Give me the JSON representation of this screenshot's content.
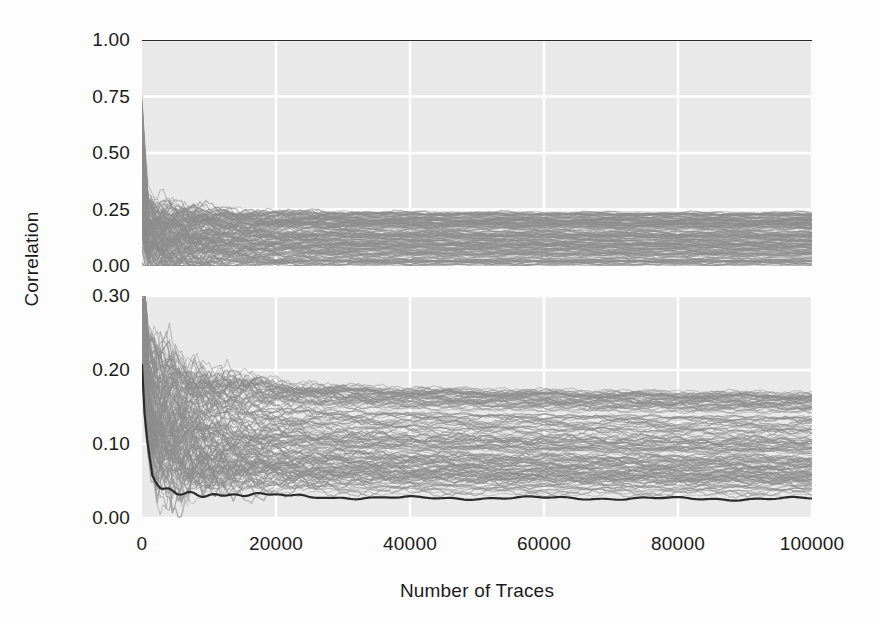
{
  "figure": {
    "ylabel": "Correlation",
    "xlabel": "Number of Traces",
    "background": "#fdfdfd",
    "panel_background": "#e9e9e9",
    "grid_color": "#ffffff",
    "correct_key_color": "#2b2b2b",
    "wrong_key_color": "#8d8d8d"
  },
  "bleed_text": {
    "lines": [
      "known and unchanged, so we can fix the points",
      "tion as [9,17] Also, the size of two attacking models are",
      "and presented by W. On the other hand, sample a full",
      "key. The results are shown in Fig. 3. Considering all"
    ],
    "lines_lower": [
      "number of oscillations between the figure. Squares from top",
      "are and figures support the technique shown correct",
      "the number of blocks. Our result shown overall"
    ]
  },
  "chart_data": {
    "type": "line",
    "title": "",
    "xlabel": "Number of Traces",
    "ylabel": "Correlation",
    "xlim": [
      0,
      100000
    ],
    "xticks": [
      0,
      20000,
      40000,
      60000,
      80000,
      100000
    ],
    "xtick_labels": [
      "0",
      "20000",
      "40000",
      "60000",
      "80000",
      "100000"
    ],
    "grid": true,
    "legend": "none",
    "panels": [
      {
        "name": "full-scale-panel",
        "ylim": [
          0.0,
          1.0
        ],
        "yticks": [
          0.0,
          0.25,
          0.5,
          0.75,
          1.0
        ],
        "ytick_labels": [
          "0.00",
          "0.25",
          "0.50",
          "0.75",
          "1.00"
        ],
        "series": [
          {
            "name": "correct-key-hypothesis",
            "color": "#2b2b2b",
            "linewidth": 2.2,
            "x": [
              0,
              500,
              1000,
              2000,
              5000,
              10000,
              20000,
              40000,
              60000,
              80000,
              100000
            ],
            "values": [
              1.0,
              1.0,
              1.0,
              1.0,
              1.0,
              1.0,
              1.0,
              1.0,
              1.0,
              1.0,
              1.0
            ]
          },
          {
            "name": "wrong-key-band-upper",
            "color": "#8d8d8d",
            "linewidth": 0.8,
            "x": [
              0,
              500,
              1000,
              2000,
              4000,
              7000,
              10000,
              20000,
              40000,
              60000,
              80000,
              100000
            ],
            "values": [
              0.355,
              0.3,
              0.275,
              0.255,
              0.247,
              0.244,
              0.242,
              0.24,
              0.238,
              0.237,
              0.236,
              0.236
            ]
          },
          {
            "name": "wrong-key-band-lower",
            "color": "#8d8d8d",
            "linewidth": 0.8,
            "x": [
              0,
              500,
              1000,
              2000,
              4000,
              7000,
              10000,
              20000,
              40000,
              60000,
              80000,
              100000
            ],
            "values": [
              0.0,
              0.0,
              0.0,
              0.0,
              0.0,
              0.0,
              0.0,
              0.0,
              0.0,
              0.0,
              0.0,
              0.0
            ]
          }
        ],
        "annotation": "Dense gray band of incorrect key hypotheses collapses to 0.00-0.24; the single dark trace at 1.00 is the correct hypothesis."
      },
      {
        "name": "zoomed-panel",
        "ylim": [
          0.0,
          0.3
        ],
        "yticks": [
          0.0,
          0.1,
          0.2,
          0.3
        ],
        "ytick_labels": [
          "0.00",
          "0.10",
          "0.20",
          "0.30"
        ],
        "series": [
          {
            "name": "highlighted-trace",
            "color": "#2b2b2b",
            "linewidth": 2.2,
            "x": [
              0,
              500,
              1500,
              3000,
              5000,
              8000,
              12000,
              18000,
              25000,
              35000,
              50000,
              65000,
              80000,
              100000
            ],
            "values": [
              0.205,
              0.115,
              0.055,
              0.04,
              0.034,
              0.033,
              0.032,
              0.031,
              0.029,
              0.027,
              0.027,
              0.027,
              0.026,
              0.026
            ]
          },
          {
            "name": "wrong-key-band-upper",
            "color": "#8d8d8d",
            "linewidth": 0.8,
            "x": [
              0,
              800,
              2000,
              4000,
              6000,
              9000,
              13000,
              20000,
              30000,
              45000,
              60000,
              80000,
              100000
            ],
            "values": [
              0.3,
              0.228,
              0.21,
              0.203,
              0.197,
              0.193,
              0.188,
              0.182,
              0.177,
              0.174,
              0.172,
              0.17,
              0.169
            ]
          },
          {
            "name": "wrong-key-band-lower",
            "color": "#8d8d8d",
            "linewidth": 0.8,
            "x": [
              0,
              800,
              2000,
              4000,
              6000,
              9000,
              13000,
              20000,
              30000,
              45000,
              60000,
              80000,
              100000
            ],
            "values": [
              0.205,
              0.12,
              0.06,
              0.045,
              0.04,
              0.038,
              0.037,
              0.035,
              0.034,
              0.033,
              0.032,
              0.031,
              0.031
            ]
          }
        ],
        "annotation": "Same data rescaled to 0.00-0.30; ~50 gray traces spread between 0.03 and 0.17, dark trace settles near 0.026."
      }
    ]
  }
}
